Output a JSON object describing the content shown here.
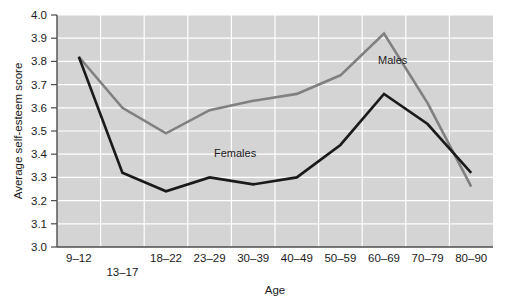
{
  "chart_data": {
    "type": "line",
    "title": "",
    "xlabel": "Age",
    "ylabel": "Average self-esteem score",
    "categories": [
      "9–12",
      "13–17",
      "18–22",
      "23–29",
      "30–39",
      "40–49",
      "50–59",
      "60–69",
      "70–79",
      "80–90"
    ],
    "ylim": [
      3.0,
      4.0
    ],
    "ytick_labels": [
      "3.0",
      "3.1",
      "3.2",
      "3.3",
      "3.4",
      "3.5",
      "3.6",
      "3.7",
      "3.8",
      "3.9",
      "4.0"
    ],
    "ytick_values": [
      3.0,
      3.1,
      3.2,
      3.3,
      3.4,
      3.5,
      3.6,
      3.7,
      3.8,
      3.9,
      4.0
    ],
    "grid": true,
    "legend_position": "inline-annotations",
    "plot_background": "#d4d4d4",
    "grid_color": "#ffffff",
    "series": [
      {
        "name": "Males",
        "color": "#808080",
        "label_text": "Males",
        "values": [
          3.82,
          3.6,
          3.49,
          3.59,
          3.63,
          3.66,
          3.74,
          3.92,
          3.62,
          3.26
        ]
      },
      {
        "name": "Females",
        "color": "#1a1a1a",
        "label_text": "Females",
        "values": [
          3.82,
          3.32,
          3.24,
          3.3,
          3.27,
          3.3,
          3.44,
          3.66,
          3.53,
          3.32
        ]
      }
    ]
  },
  "axes": {
    "y_title": "Average self-esteem score",
    "x_title": "Age"
  },
  "annotations": {
    "males_label": "Males",
    "females_label": "Females"
  }
}
